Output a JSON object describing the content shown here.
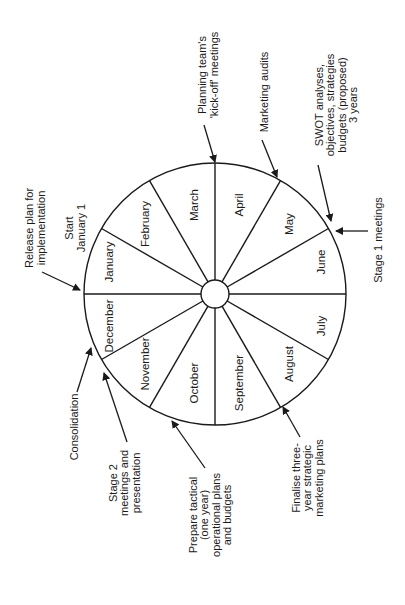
{
  "diagram": {
    "type": "annual-planning-cycle-wheel",
    "orientation_deg": -90,
    "colors": {
      "ink": "#1a1a1a",
      "background": "#ffffff"
    },
    "wheel": {
      "center": [
        215,
        294
      ],
      "outer_radius": 131,
      "inner_radius": 14,
      "months": [
        {
          "label": "January",
          "pos": [
            110,
            262
          ]
        },
        {
          "label": "February",
          "pos": [
            146,
            224
          ]
        },
        {
          "label": "March",
          "pos": [
            195,
            205
          ]
        },
        {
          "label": "April",
          "pos": [
            240,
            205
          ]
        },
        {
          "label": "May",
          "pos": [
            290,
            224
          ]
        },
        {
          "label": "June",
          "pos": [
            322,
            262
          ]
        },
        {
          "label": "July",
          "pos": [
            322,
            326
          ]
        },
        {
          "label": "August",
          "pos": [
            290,
            364
          ]
        },
        {
          "label": "September",
          "pos": [
            240,
            383
          ]
        },
        {
          "label": "October",
          "pos": [
            195,
            383
          ]
        },
        {
          "label": "November",
          "pos": [
            146,
            364
          ]
        },
        {
          "label": "December",
          "pos": [
            110,
            326
          ]
        }
      ]
    },
    "annotations": [
      {
        "id": "release-plan",
        "lines": [
          "Release plan for",
          "implementation"
        ],
        "anchor": [
          35,
          228
        ],
        "arrow": [
          [
            42,
            272
          ],
          [
            80,
            290
          ]
        ]
      },
      {
        "id": "start-january",
        "lines": [
          "Start",
          "January 1"
        ],
        "anchor": [
          75,
          228
        ],
        "arrow": null
      },
      {
        "id": "kick-off",
        "lines": [
          "Planning team's",
          "'kick-off' meetings"
        ],
        "anchor": [
          208,
          75
        ],
        "arrow": [
          [
            204,
            125
          ],
          [
            215,
            162
          ]
        ]
      },
      {
        "id": "marketing-audits",
        "lines": [
          "Marketing audits"
        ],
        "anchor": [
          264,
          92
        ],
        "arrow": [
          [
            262,
            140
          ],
          [
            277,
            177
          ]
        ]
      },
      {
        "id": "swot",
        "lines": [
          "SWOT analyses,",
          "objectives, strategies",
          "budgets (proposed)",
          "3 years"
        ],
        "anchor": [
          336,
          105
        ],
        "arrow": [
          [
            318,
            165
          ],
          [
            331,
            221
          ]
        ]
      },
      {
        "id": "stage1",
        "lines": [
          "Stage 1 meetings"
        ],
        "anchor": [
          378,
          240
        ],
        "arrow": [
          [
            368,
            231
          ],
          [
            336,
            231
          ]
        ]
      },
      {
        "id": "consolidation",
        "lines": [
          "Consolidation"
        ],
        "anchor": [
          74,
          427
        ],
        "arrow": [
          [
            77,
            392
          ],
          [
            91,
            348
          ]
        ]
      },
      {
        "id": "stage2",
        "lines": [
          "Stage 2",
          "meetings and",
          "presentation"
        ],
        "anchor": [
          124,
          483
        ],
        "arrow": [
          [
            127,
            442
          ],
          [
            104,
            373
          ]
        ]
      },
      {
        "id": "tactical",
        "lines": [
          "Prepare tactical",
          "(one year)",
          "operational plans",
          "and budgets"
        ],
        "anchor": [
          210,
          515
        ],
        "arrow": [
          [
            205,
            468
          ],
          [
            172,
            421
          ]
        ]
      },
      {
        "id": "finalise",
        "lines": [
          "Finalise three-",
          "year strategic",
          "marketing plans"
        ],
        "anchor": [
          307,
          478
        ],
        "arrow": [
          [
            300,
            437
          ],
          [
            283,
            407
          ]
        ]
      }
    ]
  }
}
